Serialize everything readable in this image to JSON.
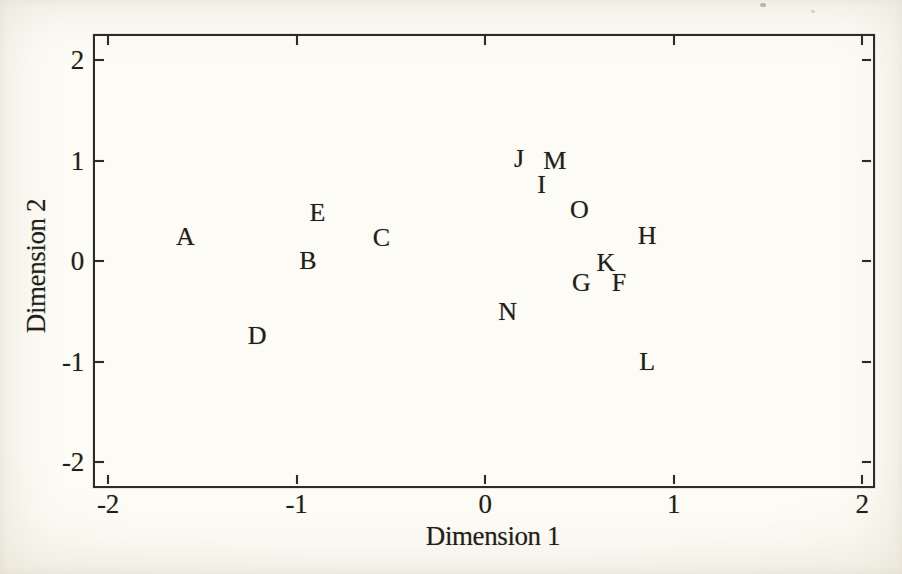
{
  "page": {
    "type": "scanned-book-figure",
    "background_color": "#f9f6ec",
    "ink_color": "#2e2b24"
  },
  "chart_data": {
    "type": "scatter",
    "title": "",
    "xlabel": "Dimension 1",
    "ylabel": "Dimension 2",
    "xlim": [
      -2.07,
      2.06
    ],
    "ylim": [
      -2.23,
      2.27
    ],
    "x_ticks": [
      -2,
      -1,
      0,
      1,
      2
    ],
    "y_ticks": [
      -2,
      -1,
      0,
      1,
      2
    ],
    "grid": false,
    "legend_position": "none",
    "marker_style": "letter-labels",
    "points": [
      {
        "label": "A",
        "x": -1.59,
        "y": 0.24
      },
      {
        "label": "B",
        "x": -0.94,
        "y": 0.0
      },
      {
        "label": "C",
        "x": -0.55,
        "y": 0.23
      },
      {
        "label": "D",
        "x": -1.21,
        "y": -0.75
      },
      {
        "label": "E",
        "x": -0.89,
        "y": 0.48
      },
      {
        "label": "F",
        "x": 0.71,
        "y": -0.22
      },
      {
        "label": "G",
        "x": 0.51,
        "y": -0.22
      },
      {
        "label": "H",
        "x": 0.86,
        "y": 0.25
      },
      {
        "label": "I",
        "x": 0.3,
        "y": 0.76
      },
      {
        "label": "J",
        "x": 0.18,
        "y": 1.01
      },
      {
        "label": "K",
        "x": 0.64,
        "y": -0.02
      },
      {
        "label": "L",
        "x": 0.86,
        "y": -1.0
      },
      {
        "label": "M",
        "x": 0.37,
        "y": 1.0
      },
      {
        "label": "N",
        "x": 0.12,
        "y": -0.51
      },
      {
        "label": "O",
        "x": 0.5,
        "y": 0.51
      }
    ]
  }
}
